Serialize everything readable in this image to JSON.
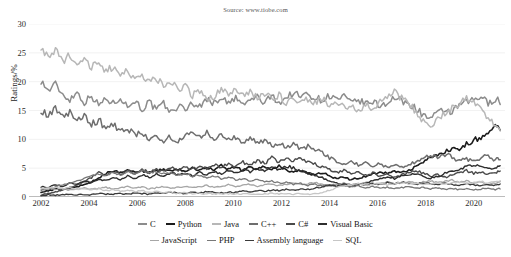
{
  "header": {
    "title_clipped": "TIOBE Programming Community Index",
    "source": "Source: www.tiobe.com"
  },
  "chart_data": {
    "type": "line",
    "title": "TIOBE Programming Community Index",
    "subtitle": "Source: www.tiobe.com",
    "xlabel": "",
    "ylabel": "Ratings/%",
    "xlim": [
      2001.5,
      2021.3
    ],
    "ylim": [
      0,
      30
    ],
    "yticks": [
      0,
      5,
      10,
      15,
      20,
      25,
      30
    ],
    "xticks": [
      2002,
      2004,
      2006,
      2008,
      2010,
      2012,
      2014,
      2016,
      2018,
      2020
    ],
    "grid": "horizontal",
    "legend_position": "bottom",
    "x": [
      2002.0,
      2002.3,
      2002.6,
      2002.9,
      2003.2,
      2003.5,
      2003.8,
      2004.1,
      2004.4,
      2004.7,
      2005.0,
      2005.3,
      2005.6,
      2005.9,
      2006.2,
      2006.5,
      2006.8,
      2007.1,
      2007.4,
      2007.7,
      2008.0,
      2008.3,
      2008.6,
      2008.9,
      2009.2,
      2009.5,
      2009.8,
      2010.1,
      2010.4,
      2010.7,
      2011.0,
      2011.3,
      2011.6,
      2011.9,
      2012.2,
      2012.5,
      2012.8,
      2013.1,
      2013.4,
      2013.7,
      2014.0,
      2014.3,
      2014.6,
      2014.9,
      2015.2,
      2015.5,
      2015.8,
      2016.1,
      2016.4,
      2016.7,
      2017.0,
      2017.3,
      2017.6,
      2017.9,
      2018.2,
      2018.5,
      2018.8,
      2019.1,
      2019.4,
      2019.7,
      2020.0,
      2020.3,
      2020.6,
      2020.9,
      2021.1
    ],
    "series": [
      {
        "name": "C",
        "color": "#8c8c8c",
        "width": 1.5,
        "values": [
          20.2,
          18.4,
          19.6,
          17.8,
          16.9,
          18.2,
          16.4,
          17.6,
          15.9,
          17.1,
          16.2,
          17.4,
          15.6,
          16.8,
          15.2,
          16.5,
          15.0,
          16.2,
          14.6,
          15.8,
          15.2,
          16.4,
          15.6,
          17.1,
          16.2,
          17.4,
          16.1,
          17.2,
          15.9,
          16.8,
          17.4,
          16.2,
          17.6,
          16.4,
          17.2,
          18.1,
          17.4,
          17.9,
          17.2,
          16.8,
          17.6,
          16.9,
          17.4,
          16.2,
          16.8,
          16.1,
          16.5,
          15.8,
          16.4,
          17.2,
          16.6,
          16.1,
          15.4,
          14.2,
          13.6,
          14.4,
          15.2,
          14.6,
          15.9,
          16.4,
          16.8,
          17.4,
          16.2,
          17.1,
          16.4
        ]
      },
      {
        "name": "Python",
        "color": "#1c1c1c",
        "width": 1.6,
        "values": [
          0.9,
          1.1,
          1.4,
          1.2,
          1.6,
          1.8,
          2.2,
          2.6,
          3.2,
          4.1,
          4.6,
          4.2,
          4.8,
          4.4,
          4.6,
          4.2,
          4.5,
          4.8,
          4.4,
          4.9,
          4.6,
          5.1,
          4.7,
          5.2,
          4.8,
          5.4,
          4.9,
          5.1,
          4.6,
          5.2,
          4.8,
          5.3,
          4.9,
          5.4,
          4.6,
          4.2,
          4.6,
          4.1,
          3.8,
          4.2,
          3.6,
          3.2,
          3.4,
          3.0,
          3.3,
          3.6,
          4.0,
          4.3,
          4.1,
          4.5,
          4.2,
          4.7,
          5.2,
          6.1,
          6.8,
          7.2,
          7.9,
          8.4,
          8.1,
          9.2,
          9.8,
          10.4,
          11.2,
          12.1,
          11.6
        ]
      },
      {
        "name": "Java",
        "color": "#b7b7b7",
        "width": 1.5,
        "values": [
          26.1,
          24.2,
          25.6,
          23.4,
          24.8,
          22.9,
          24.1,
          22.4,
          23.6,
          21.8,
          22.6,
          21.2,
          22.1,
          20.4,
          21.4,
          19.8,
          20.6,
          19.2,
          20.1,
          18.4,
          19.2,
          17.6,
          18.4,
          16.8,
          17.4,
          18.6,
          17.8,
          18.9,
          17.6,
          18.4,
          17.2,
          18.1,
          16.8,
          17.6,
          16.4,
          17.2,
          16.1,
          17.0,
          16.2,
          17.1,
          15.8,
          16.4,
          15.4,
          16.2,
          15.1,
          16.0,
          15.2,
          16.4,
          17.2,
          18.1,
          17.2,
          16.1,
          14.8,
          13.2,
          12.1,
          13.4,
          14.6,
          15.4,
          16.2,
          17.1,
          16.4,
          15.2,
          13.8,
          12.1,
          11.2
        ]
      },
      {
        "name": "C++",
        "color": "#6e6e6e",
        "width": 1.5,
        "values": [
          15.1,
          14.2,
          15.6,
          13.8,
          14.6,
          13.2,
          14.1,
          12.6,
          13.4,
          11.8,
          12.6,
          11.2,
          12.1,
          10.6,
          11.4,
          10.2,
          10.8,
          9.8,
          10.4,
          9.4,
          10.6,
          11.2,
          10.4,
          11.1,
          10.2,
          10.8,
          9.8,
          10.4,
          9.6,
          10.1,
          9.2,
          9.8,
          8.9,
          9.4,
          8.6,
          9.1,
          8.4,
          8.8,
          8.1,
          7.6,
          6.8,
          6.2,
          5.8,
          6.2,
          5.6,
          6.1,
          5.4,
          5.8,
          5.2,
          5.6,
          5.1,
          5.6,
          6.1,
          6.8,
          7.2,
          6.8,
          7.4,
          6.9,
          6.2,
          6.6,
          6.1,
          6.8,
          7.2,
          6.4,
          6.8
        ]
      },
      {
        "name": "C#",
        "color": "#4a4a4a",
        "width": 1.4,
        "values": [
          0.4,
          0.6,
          0.9,
          1.2,
          1.6,
          2.1,
          2.8,
          3.4,
          4.2,
          3.8,
          4.4,
          3.9,
          4.6,
          4.1,
          4.8,
          4.2,
          4.9,
          4.4,
          5.1,
          4.6,
          5.2,
          4.8,
          5.4,
          4.9,
          5.6,
          5.1,
          5.8,
          5.2,
          6.1,
          5.4,
          6.4,
          5.8,
          6.8,
          6.1,
          6.6,
          6.2,
          6.8,
          6.1,
          5.8,
          5.2,
          4.8,
          4.2,
          4.6,
          4.1,
          4.4,
          3.8,
          4.2,
          3.6,
          4.0,
          3.4,
          3.8,
          4.2,
          4.6,
          4.1,
          3.6,
          3.9,
          3.4,
          3.8,
          4.2,
          4.6,
          4.1,
          4.4,
          3.9,
          4.2,
          4.6
        ]
      },
      {
        "name": "Visual Basic",
        "color": "#2e2e2e",
        "width": 1.4,
        "values": [
          1.8,
          1.6,
          2.1,
          1.9,
          2.4,
          2.2,
          2.8,
          2.4,
          3.1,
          2.8,
          3.4,
          3.1,
          3.6,
          3.2,
          3.8,
          3.4,
          4.0,
          3.6,
          4.2,
          3.8,
          4.1,
          3.6,
          4.2,
          3.8,
          4.4,
          4.0,
          4.6,
          4.2,
          4.8,
          4.4,
          5.0,
          4.6,
          5.2,
          4.8,
          5.4,
          5.0,
          4.6,
          4.2,
          3.8,
          3.4,
          2.8,
          2.4,
          2.1,
          1.8,
          2.2,
          2.4,
          2.8,
          3.1,
          3.4,
          3.2,
          3.6,
          3.8,
          4.1,
          3.6,
          3.2,
          3.6,
          4.1,
          4.4,
          4.8,
          5.2,
          5.6,
          5.2,
          4.8,
          5.1,
          5.4
        ]
      },
      {
        "name": "JavaScript",
        "color": "#a6a6a6",
        "width": 1.3,
        "values": [
          1.4,
          1.6,
          1.3,
          1.5,
          1.2,
          1.4,
          1.6,
          1.3,
          1.5,
          1.7,
          1.4,
          1.6,
          1.8,
          1.5,
          1.7,
          1.4,
          1.6,
          1.8,
          1.5,
          1.7,
          1.9,
          1.6,
          1.8,
          2.0,
          1.7,
          1.9,
          2.1,
          1.8,
          2.0,
          2.2,
          1.9,
          2.1,
          2.3,
          2.0,
          2.2,
          2.4,
          2.1,
          2.3,
          2.5,
          2.2,
          2.0,
          2.2,
          2.4,
          2.1,
          2.3,
          2.5,
          2.2,
          2.4,
          2.6,
          2.3,
          2.5,
          2.7,
          2.4,
          2.6,
          2.8,
          2.5,
          2.7,
          2.9,
          2.6,
          2.8,
          2.4,
          2.6,
          2.2,
          2.4,
          2.6
        ]
      },
      {
        "name": "PHP",
        "color": "#787878",
        "width": 1.3,
        "values": [
          1.2,
          1.4,
          1.8,
          2.1,
          2.4,
          2.8,
          3.2,
          3.6,
          4.1,
          3.8,
          4.2,
          3.9,
          4.4,
          4.1,
          4.6,
          4.2,
          4.4,
          4.0,
          4.2,
          3.8,
          4.0,
          3.6,
          3.8,
          3.4,
          3.6,
          3.2,
          3.4,
          3.0,
          3.2,
          2.8,
          3.0,
          2.6,
          2.8,
          2.4,
          2.6,
          2.2,
          2.4,
          2.0,
          2.2,
          1.9,
          2.1,
          1.8,
          2.0,
          1.7,
          1.9,
          1.6,
          1.8,
          1.5,
          1.7,
          1.4,
          1.6,
          1.8,
          1.5,
          1.7,
          1.4,
          1.6,
          1.3,
          1.5,
          1.3,
          1.4,
          1.2,
          1.4,
          1.6,
          1.3,
          1.5
        ]
      },
      {
        "name": "Assembly language",
        "color": "#3a3a3a",
        "width": 1.3,
        "values": [
          0.3,
          0.4,
          0.3,
          0.5,
          0.4,
          0.3,
          0.5,
          0.4,
          0.6,
          0.5,
          0.4,
          0.6,
          0.5,
          0.7,
          0.6,
          0.5,
          0.7,
          0.6,
          0.8,
          0.7,
          0.6,
          0.8,
          0.7,
          0.9,
          0.8,
          0.7,
          0.9,
          0.8,
          1.0,
          0.9,
          1.1,
          1.0,
          1.2,
          1.1,
          1.3,
          1.2,
          1.4,
          1.3,
          1.6,
          1.8,
          2.1,
          1.9,
          2.2,
          2.0,
          2.3,
          2.1,
          2.4,
          2.2,
          2.5,
          2.3,
          2.6,
          2.4,
          2.2,
          2.5,
          2.3,
          2.1,
          2.4,
          2.2,
          2.0,
          2.3,
          2.1,
          1.9,
          2.2,
          2.0,
          2.3
        ]
      },
      {
        "name": "SQL",
        "color": "#c6c6c6",
        "width": 1.3,
        "values": [
          1.6,
          1.5,
          1.7,
          1.4,
          1.6,
          1.3,
          1.5,
          1.2,
          1.4,
          1.1,
          1.3,
          1.0,
          1.2,
          0.9,
          1.1,
          0.8,
          1.0,
          0.7,
          0.9,
          0.6,
          0.8,
          0.6,
          0.7,
          0.5,
          0.6,
          0.5,
          0.6,
          0.5,
          0.6,
          0.5,
          0.6,
          0.5,
          0.6,
          0.5,
          0.6,
          0.5,
          0.6,
          0.5,
          0.6,
          0.8,
          1.2,
          1.6,
          1.9,
          2.1,
          2.3,
          2.0,
          2.2,
          2.4,
          2.1,
          2.3,
          2.5,
          2.2,
          2.4,
          2.1,
          2.3,
          2.5,
          2.2,
          2.4,
          2.6,
          2.3,
          2.5,
          2.7,
          2.4,
          2.6,
          2.8
        ]
      }
    ]
  }
}
